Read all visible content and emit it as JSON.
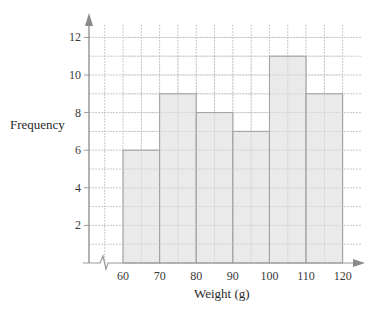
{
  "chart_data": {
    "type": "bar",
    "subtype": "histogram",
    "title": "",
    "xlabel": "Weight (g)",
    "ylabel": "Frequency",
    "bins": [
      [
        60,
        70
      ],
      [
        70,
        80
      ],
      [
        80,
        90
      ],
      [
        90,
        100
      ],
      [
        100,
        110
      ],
      [
        110,
        120
      ]
    ],
    "categories": [
      "60-70",
      "70-80",
      "80-90",
      "90-100",
      "100-110",
      "110-120"
    ],
    "values": [
      6,
      9,
      8,
      7,
      11,
      9
    ],
    "x_ticks": [
      60,
      70,
      80,
      90,
      100,
      110,
      120
    ],
    "y_ticks": [
      2,
      4,
      6,
      8,
      10,
      12
    ],
    "xlim": [
      50,
      125
    ],
    "ylim": [
      0,
      13
    ],
    "grid": true,
    "axis_break_on_x": true,
    "legend": null,
    "colors": {
      "bar_fill": "#e6e6e6",
      "bar_edge": "#9a9a9a",
      "grid": "#c8c8c8",
      "axis": "#9a9a9a"
    }
  }
}
